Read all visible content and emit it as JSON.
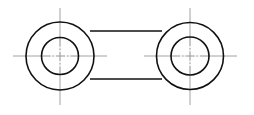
{
  "diagram": {
    "type": "engineering-drawing",
    "colors": {
      "background": "#ffffff",
      "outline": "#111111",
      "centerline": "#8a8a8a"
    },
    "bosses": [
      {
        "id": "left-boss",
        "center": [
          60,
          56
        ],
        "outer_radius": 34,
        "inner_radius": 18.5,
        "vertical_centerline": [
          8,
          105
        ],
        "horizontal_centerline": [
          13,
          107
        ]
      },
      {
        "id": "right-boss",
        "center": [
          190,
          56
        ],
        "outer_radius": 33.5,
        "inner_radius": 19,
        "vertical_centerline": [
          8,
          105
        ],
        "horizontal_centerline": [
          144,
          237
        ]
      }
    ],
    "connecting_edges": {
      "top_y": 31,
      "bottom_y": 79,
      "x_start": 90,
      "x_end": 162
    }
  }
}
